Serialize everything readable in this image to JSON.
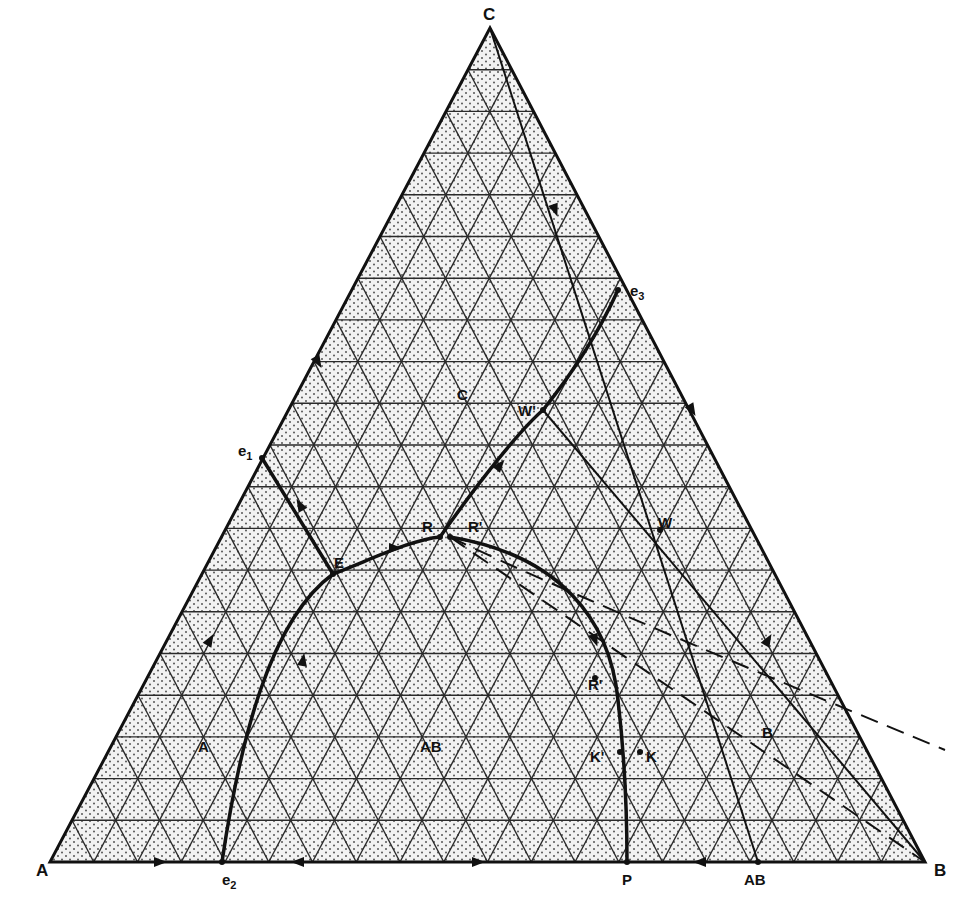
{
  "figure": {
    "type": "ternary-phase-diagram",
    "vertices": {
      "A": {
        "label": "A",
        "x": 50,
        "y": 862
      },
      "B": {
        "label": "B",
        "x": 925,
        "y": 862
      },
      "C": {
        "label": "C",
        "x": 490,
        "y": 28
      }
    },
    "grid_divisions": 20,
    "colors": {
      "ink": "#111111",
      "fill": "#f2f2f2",
      "grid": "#2a2a2a",
      "dots": "#555555"
    },
    "points": [
      {
        "id": "e1",
        "label": "e",
        "sub": "1",
        "x": 262,
        "y": 458,
        "lx": 238,
        "ly": 456
      },
      {
        "id": "e2",
        "label": "e",
        "sub": "2",
        "x": 222,
        "y": 862,
        "lx": 222,
        "ly": 885
      },
      {
        "id": "e3",
        "label": "e",
        "sub": "3",
        "x": 618,
        "y": 290,
        "lx": 630,
        "ly": 296
      },
      {
        "id": "P",
        "label": "P",
        "x": 627,
        "y": 862,
        "lx": 622,
        "ly": 885
      },
      {
        "id": "AB",
        "label": "AB",
        "x": 758,
        "y": 862,
        "lx": 744,
        "ly": 885
      },
      {
        "id": "E",
        "label": "E",
        "x": 333,
        "y": 574,
        "lx": 334,
        "ly": 568
      },
      {
        "id": "R",
        "label": "R",
        "x": 440,
        "y": 537,
        "lx": 422,
        "ly": 532
      },
      {
        "id": "R1",
        "label": "R'",
        "x": 450,
        "y": 537,
        "lx": 468,
        "ly": 532
      },
      {
        "id": "W1",
        "label": "W'",
        "x": 543,
        "y": 410,
        "lx": 518,
        "ly": 416
      },
      {
        "id": "W",
        "label": "W",
        "x": 660,
        "y": 530,
        "lx": 658,
        "ly": 528
      },
      {
        "id": "R2",
        "label": "R'",
        "x": 595,
        "y": 678,
        "lx": 588,
        "ly": 690
      },
      {
        "id": "K1",
        "label": "K'",
        "x": 620,
        "y": 752,
        "lx": 590,
        "ly": 762
      },
      {
        "id": "K",
        "label": "K",
        "x": 640,
        "y": 752,
        "lx": 646,
        "ly": 762
      }
    ],
    "region_labels": [
      {
        "id": "region-A",
        "label": "A",
        "x": 198,
        "y": 752
      },
      {
        "id": "region-AB",
        "label": "AB",
        "x": 420,
        "y": 752
      },
      {
        "id": "region-B",
        "label": "B",
        "x": 762,
        "y": 738
      },
      {
        "id": "region-C",
        "label": "C",
        "x": 457,
        "y": 400
      }
    ],
    "boundary_curves": [
      {
        "id": "e1-E",
        "path": "M262,458 L333,574"
      },
      {
        "id": "e2-E",
        "path": "M222,862 C240,740 270,620 333,574"
      },
      {
        "id": "E-R",
        "path": "M333,574 C370,560 410,540 440,537"
      },
      {
        "id": "R-e3",
        "path": "M440,537 C480,480 520,430 543,410 C575,370 600,330 618,290"
      },
      {
        "id": "R-P",
        "path": "M450,537 C560,555 610,620 618,700 C625,760 627,820 627,862"
      }
    ],
    "construction_lines": [
      {
        "id": "C-AB",
        "path": "M490,28 L758,862",
        "dash": false
      },
      {
        "id": "W1-B",
        "path": "M543,410 L925,862",
        "dash": false
      },
      {
        "id": "R-B",
        "path": "M450,537 L925,862",
        "dash": true
      },
      {
        "id": "R-ext",
        "path": "M450,537 C560,590 800,690 945,750",
        "dash": true
      }
    ],
    "arrows": [
      {
        "x": 160,
        "y": 862,
        "angle": 0
      },
      {
        "x": 298,
        "y": 862,
        "angle": 180
      },
      {
        "x": 478,
        "y": 862,
        "angle": 0
      },
      {
        "x": 700,
        "y": 862,
        "angle": 180
      },
      {
        "x": 318,
        "y": 362,
        "angle": 60
      },
      {
        "x": 210,
        "y": 640,
        "angle": -60
      },
      {
        "x": 692,
        "y": 410,
        "angle": 60
      },
      {
        "x": 768,
        "y": 640,
        "angle": -60
      },
      {
        "x": 555,
        "y": 210,
        "angle": 70
      },
      {
        "x": 300,
        "y": 505,
        "angle": -120
      },
      {
        "x": 303,
        "y": 660,
        "angle": -80
      },
      {
        "x": 395,
        "y": 548,
        "angle": 0
      },
      {
        "x": 500,
        "y": 465,
        "angle": -50
      },
      {
        "x": 595,
        "y": 640,
        "angle": 70
      }
    ]
  }
}
